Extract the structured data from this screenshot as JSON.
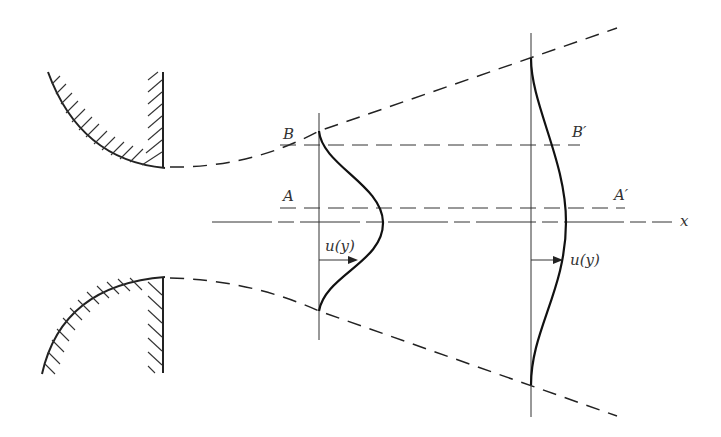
{
  "diagram": {
    "labels": {
      "B": "B",
      "B_prime": "B′",
      "A": "A",
      "A_prime": "A′",
      "x_axis": "x",
      "velocity_profile_1": "u(y)",
      "velocity_profile_2": "u(y)"
    },
    "elements": [
      "nozzle-upper-wall (hatched)",
      "nozzle-lower-wall (hatched)",
      "jet-boundary-upper (dashed)",
      "jet-boundary-lower (dashed)",
      "line-B-B-prime (dashed)",
      "line-A-A-prime (dashed)",
      "x-axis (centerline)",
      "velocity-profile-1",
      "velocity-profile-2"
    ],
    "colors": {
      "line": "#222222",
      "background": "#ffffff"
    }
  }
}
